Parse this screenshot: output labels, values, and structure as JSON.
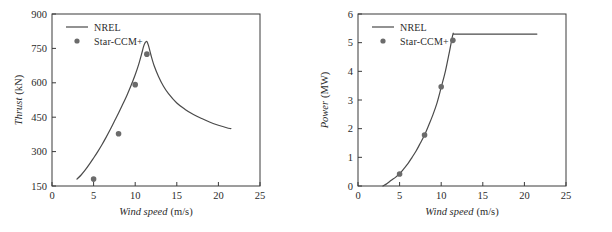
{
  "figure": {
    "panel_count": 2,
    "marker_color": "#6b6b6b",
    "line_color": "#4a4a4a",
    "axis_color": "#3a3a3a",
    "background": "#ffffff"
  },
  "chart_data": [
    {
      "type": "line",
      "panel": "left",
      "title": "",
      "xlabel": "Wind speed",
      "xunit": "(m/s)",
      "ylabel": "Thrust",
      "yunit": "(kN)",
      "xlim": [
        0,
        25
      ],
      "ylim": [
        150,
        900
      ],
      "xticks": [
        0,
        5,
        10,
        15,
        20,
        25
      ],
      "yticks": [
        150,
        300,
        450,
        600,
        750,
        900
      ],
      "xtick_labels": [
        "0",
        "5",
        "10",
        "15",
        "20",
        "25"
      ],
      "ytick_labels": [
        "150",
        "300",
        "450",
        "600",
        "750",
        "900"
      ],
      "grid": false,
      "legend_position": "top-left",
      "series": [
        {
          "name": "NREL",
          "style": "line",
          "x": [
            3.0,
            3.5,
            4.0,
            4.5,
            5.0,
            5.5,
            6.0,
            6.5,
            7.0,
            7.5,
            8.0,
            8.5,
            9.0,
            9.5,
            10.0,
            10.4,
            10.8,
            11.0,
            11.2,
            11.4,
            11.6,
            11.9,
            12.3,
            12.8,
            13.4,
            14.0,
            15.0,
            16.0,
            17.0,
            18.0,
            19.0,
            20.0,
            21.0,
            21.5
          ],
          "values": [
            180,
            198,
            220,
            245,
            272,
            300,
            330,
            362,
            396,
            432,
            468,
            506,
            545,
            588,
            635,
            678,
            730,
            758,
            775,
            780,
            762,
            720,
            672,
            628,
            585,
            553,
            512,
            484,
            462,
            444,
            428,
            415,
            404,
            400
          ]
        },
        {
          "name": "Star-CCM+",
          "style": "markers",
          "x": [
            5.0,
            8.0,
            10.0,
            11.4
          ],
          "values": [
            180,
            378,
            592,
            725
          ]
        }
      ]
    },
    {
      "type": "line",
      "panel": "right",
      "title": "",
      "xlabel": "Wind speed",
      "xunit": "(m/s)",
      "ylabel": "Power",
      "yunit": "(MW)",
      "xlim": [
        0,
        25
      ],
      "ylim": [
        0,
        6
      ],
      "xticks": [
        0,
        5,
        10,
        15,
        20,
        25
      ],
      "yticks": [
        0,
        1,
        2,
        3,
        4,
        5,
        6
      ],
      "xtick_labels": [
        "0",
        "5",
        "10",
        "15",
        "20",
        "25"
      ],
      "ytick_labels": [
        "0",
        "1",
        "2",
        "3",
        "4",
        "5",
        "6"
      ],
      "grid": false,
      "legend_position": "top-left",
      "series": [
        {
          "name": "NREL",
          "style": "line",
          "x": [
            3.0,
            3.5,
            4.0,
            4.5,
            5.0,
            5.5,
            6.0,
            6.5,
            7.0,
            7.5,
            8.0,
            8.5,
            9.0,
            9.5,
            10.0,
            10.5,
            11.0,
            11.4,
            11.6,
            13.0,
            15.0,
            17.0,
            19.0,
            21.0,
            21.5
          ],
          "values": [
            0.0,
            0.09,
            0.2,
            0.3,
            0.43,
            0.6,
            0.78,
            1.0,
            1.23,
            1.5,
            1.78,
            2.12,
            2.48,
            2.9,
            3.44,
            4.0,
            4.7,
            5.28,
            5.3,
            5.3,
            5.3,
            5.3,
            5.3,
            5.3,
            5.3
          ]
        },
        {
          "name": "Star-CCM+",
          "style": "markers",
          "x": [
            5.0,
            8.0,
            10.0,
            11.4
          ],
          "values": [
            0.42,
            1.78,
            3.46,
            5.08
          ]
        }
      ]
    }
  ],
  "legend": {
    "entries": [
      {
        "label": "NREL",
        "style": "line"
      },
      {
        "label": "Star-CCM+",
        "style": "marker"
      }
    ]
  }
}
